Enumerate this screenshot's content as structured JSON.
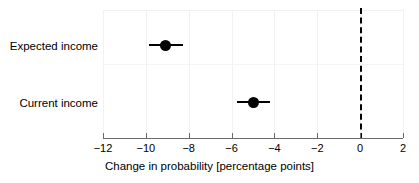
{
  "chart_data": {
    "type": "scatter",
    "subtype": "coefficient-plot-with-confidence-intervals",
    "orientation": "horizontal",
    "title": "",
    "xlabel": "Change in probability [percentage points]",
    "ylabel": "",
    "xlim": [
      -12,
      2
    ],
    "xticks": [
      -12,
      -10,
      -8,
      -6,
      -4,
      -2,
      0,
      2
    ],
    "xticklabels": [
      "−12",
      "−10",
      "−8",
      "−6",
      "−4",
      "−2",
      "0",
      "2"
    ],
    "categories": [
      "Expected income",
      "Current income"
    ],
    "grid": "faint",
    "legend": "none",
    "reference_line": {
      "x": 0,
      "style": "dashed",
      "color": "#000000"
    },
    "marker": {
      "shape": "circle",
      "color": "#000000",
      "size": 11
    },
    "points": [
      {
        "category": "Expected income",
        "estimate": -9.1,
        "ci_low": -9.85,
        "ci_high": -8.25
      },
      {
        "category": "Current income",
        "estimate": -5.0,
        "ci_low": -5.75,
        "ci_high": -4.2
      }
    ]
  },
  "axis": {
    "x_title": "Change in probability [percentage points]",
    "ticks": [
      {
        "value": -12,
        "label": "−12"
      },
      {
        "value": -10,
        "label": "−10"
      },
      {
        "value": -8,
        "label": "−8"
      },
      {
        "value": -6,
        "label": "−6"
      },
      {
        "value": -4,
        "label": "−4"
      },
      {
        "value": -2,
        "label": "−2"
      },
      {
        "value": 0,
        "label": "0"
      },
      {
        "value": 2,
        "label": "2"
      }
    ]
  },
  "rows": [
    {
      "label": "Expected income"
    },
    {
      "label": "Current income"
    }
  ],
  "colors": {
    "marker": "#000000",
    "axis": "#6b6b6b",
    "grid": "#f2f2f2",
    "reference": "#000000",
    "background": "#ffffff"
  }
}
